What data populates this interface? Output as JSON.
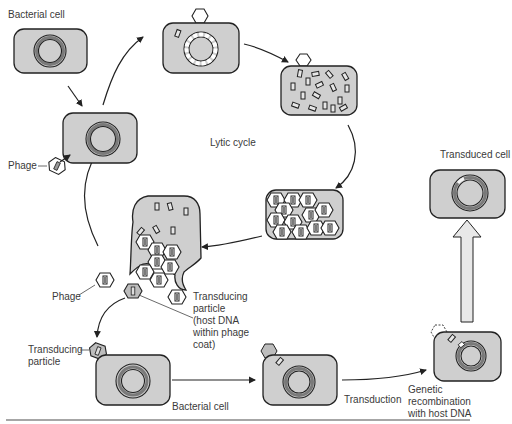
{
  "figure": {
    "labels": {
      "bacterial_cell_top": "Bacterial cell",
      "phage_left": "Phage",
      "lytic_cycle": "Lytic cycle",
      "phage_lower": "Phage",
      "transducing_particle_desc": [
        "Transducing",
        "particle",
        "(host DNA",
        "within phage",
        "coat)"
      ],
      "transducing_particle_attach": [
        "Transducing",
        "particle"
      ],
      "bacterial_cell_bottom": "Bacterial cell",
      "transduction": "Transduction",
      "genetic_recombination": [
        "Genetic",
        "recombination",
        "with host DNA"
      ],
      "transduced_cell": "Transduced cell"
    },
    "colors": {
      "cell_fill": "#cfcfcf",
      "outline": "#222222",
      "chromosome_ring": "#7a7a7a",
      "text": "#3a3a3a"
    },
    "stages": [
      "Bacterial cell",
      "Phage attaches to bacterial cell",
      "Phage DNA injected; host DNA fragmented",
      "Phage DNA replicated; host DNA fragments",
      "Phage particles assembled",
      "Cell lyses releasing phages and transducing particles",
      "Transducing particle infects new bacterial cell",
      "Host DNA fragment injected",
      "Genetic recombination with host DNA",
      "Transduced cell"
    ]
  }
}
